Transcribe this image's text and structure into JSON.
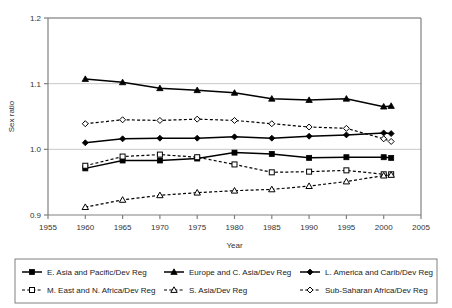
{
  "chart_data": {
    "type": "line",
    "title": "",
    "xlabel": "Year",
    "ylabel": "Sex ratio",
    "xlim": [
      1955,
      2005
    ],
    "ylim": [
      0.9,
      1.2
    ],
    "xticks": [
      1955,
      1960,
      1965,
      1970,
      1975,
      1980,
      1985,
      1990,
      1995,
      2000,
      2005
    ],
    "yticks": [
      0.9,
      1.0,
      1.1,
      1.2
    ],
    "ytick_labels": [
      "0.9",
      "1.0",
      "1.1",
      "1.2"
    ],
    "xtick_labels": [
      "1955",
      "1960",
      "1965",
      "1970",
      "1975",
      "1980",
      "1985",
      "1990",
      "1995",
      "2000",
      "2005"
    ],
    "grid": "horizontal",
    "legend_position": "bottom",
    "x": [
      1960,
      1965,
      1970,
      1975,
      1980,
      1985,
      1990,
      1995,
      2000,
      2001
    ],
    "series": [
      {
        "name": "E. Asia and Pacific/Dev Reg",
        "marker": "filled-square",
        "line": "solid",
        "color": "#000000",
        "values": [
          0.971,
          0.983,
          0.983,
          0.986,
          0.995,
          0.993,
          0.987,
          0.988,
          0.988,
          0.987
        ]
      },
      {
        "name": "Europe and C. Asia/Dev Reg",
        "marker": "filled-triangle",
        "line": "solid",
        "color": "#000000",
        "values": [
          1.107,
          1.102,
          1.093,
          1.09,
          1.086,
          1.077,
          1.075,
          1.077,
          1.065,
          1.066
        ]
      },
      {
        "name": "L. America and Carib/Dev Reg",
        "marker": "filled-diamond",
        "line": "solid",
        "color": "#000000",
        "values": [
          1.01,
          1.016,
          1.017,
          1.017,
          1.019,
          1.017,
          1.02,
          1.022,
          1.025,
          1.024
        ]
      },
      {
        "name": "M. East and N. Africa/Dev Reg",
        "marker": "hollow-square",
        "line": "dashed",
        "color": "#000000",
        "values": [
          0.975,
          0.989,
          0.992,
          0.988,
          0.977,
          0.965,
          0.966,
          0.968,
          0.962,
          0.962
        ]
      },
      {
        "name": "S. Asia/Dev Reg",
        "marker": "hollow-triangle",
        "line": "dashed",
        "color": "#000000",
        "values": [
          0.912,
          0.923,
          0.93,
          0.934,
          0.937,
          0.939,
          0.944,
          0.951,
          0.96,
          0.961
        ]
      },
      {
        "name": "Sub-Saharan Africa/Dev Reg",
        "marker": "hollow-diamond",
        "line": "dashed",
        "color": "#000000",
        "values": [
          1.039,
          1.045,
          1.044,
          1.046,
          1.044,
          1.039,
          1.034,
          1.032,
          1.016,
          1.012
        ]
      }
    ]
  },
  "legend": {
    "items": [
      {
        "label": "E. Asia and Pacific/Dev Reg"
      },
      {
        "label": "Europe and C. Asia/Dev Reg"
      },
      {
        "label": "L. America and Carib/Dev Reg"
      },
      {
        "label": "M. East and N. Africa/Dev Reg"
      },
      {
        "label": "S. Asia/Dev Reg"
      },
      {
        "label": "Sub-Saharan Africa/Dev Reg"
      }
    ]
  },
  "axes": {
    "x_title": "Year",
    "y_title": "Sex ratio"
  },
  "colors": {
    "ink": "#000000",
    "axis": "#808080",
    "grid": "#c8c8c8",
    "tick_text": "#333333",
    "legend_border": "#808080"
  }
}
